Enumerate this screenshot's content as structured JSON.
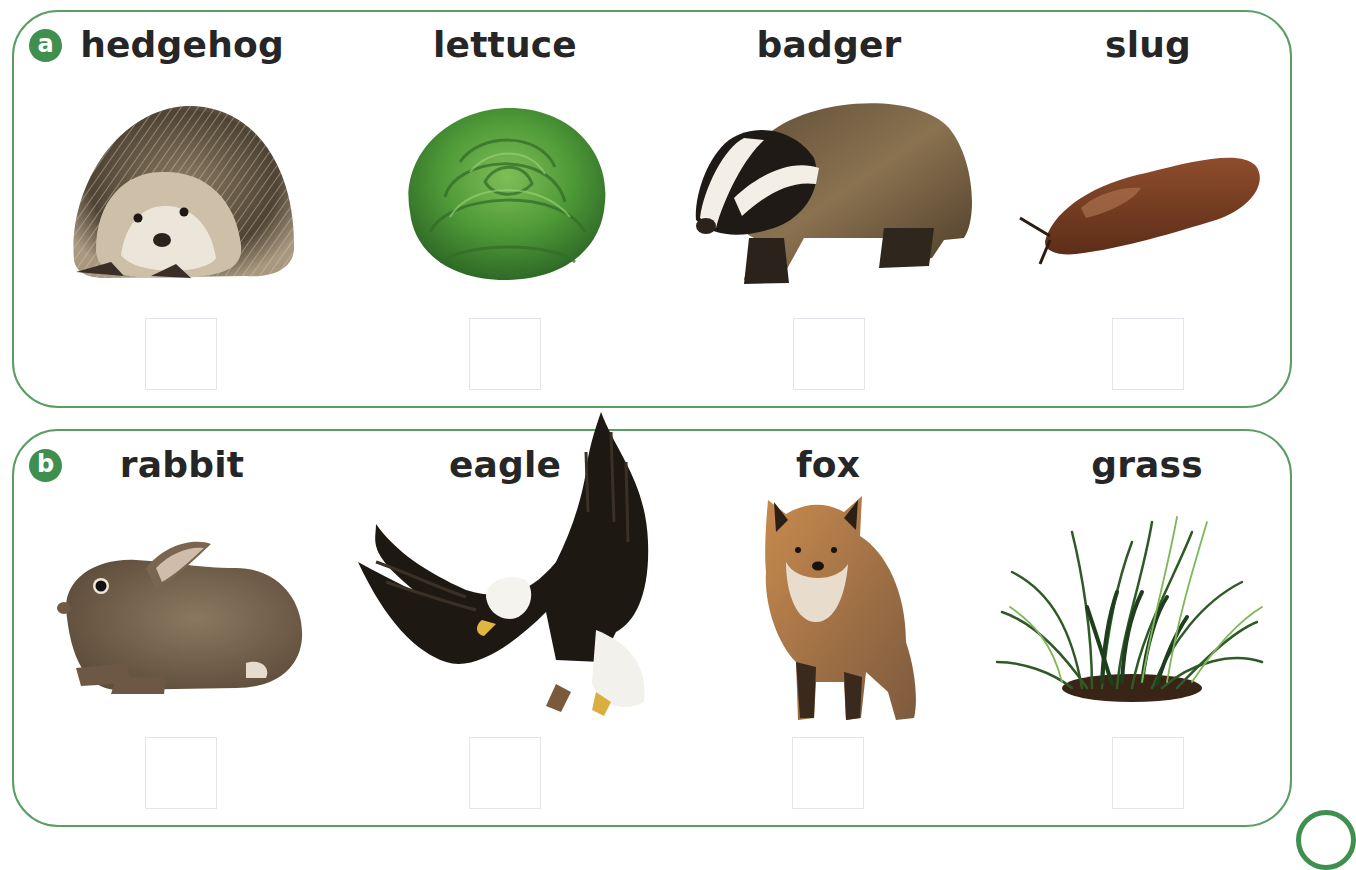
{
  "exercise": {
    "accent_color": "#3f8f4f",
    "border_color": "#5a9e64",
    "sections": [
      {
        "badge": "a",
        "items": [
          {
            "label": "hedgehog",
            "picture": "hedgehog-photo",
            "answer": ""
          },
          {
            "label": "lettuce",
            "picture": "lettuce-photo",
            "answer": ""
          },
          {
            "label": "badger",
            "picture": "badger-photo",
            "answer": ""
          },
          {
            "label": "slug",
            "picture": "slug-photo",
            "answer": ""
          }
        ]
      },
      {
        "badge": "b",
        "items": [
          {
            "label": "rabbit",
            "picture": "rabbit-photo",
            "answer": ""
          },
          {
            "label": "eagle",
            "picture": "eagle-photo",
            "answer": ""
          },
          {
            "label": "fox",
            "picture": "fox-photo",
            "answer": ""
          },
          {
            "label": "grass",
            "picture": "grass-photo",
            "answer": ""
          }
        ]
      }
    ]
  }
}
